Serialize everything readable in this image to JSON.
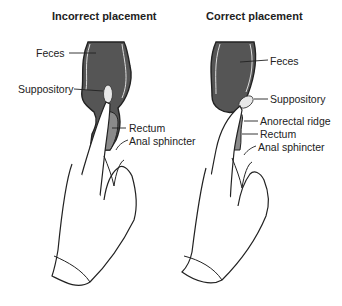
{
  "panels": [
    {
      "title": "Incorrect placement",
      "labels": {
        "feces": "Feces",
        "suppository": "Suppository",
        "rectum": "Rectum",
        "anal_sphincter": "Anal sphincter"
      }
    },
    {
      "title": "Correct placement",
      "labels": {
        "feces": "Feces",
        "suppository": "Suppository",
        "anorectal_ridge": "Anorectal ridge",
        "rectum": "Rectum",
        "anal_sphincter": "Anal sphincter"
      }
    }
  ],
  "colors": {
    "feces": "#555555",
    "rectum": "#8a8a8a",
    "suppository": "#e8e8e8",
    "outline": "#222222"
  }
}
